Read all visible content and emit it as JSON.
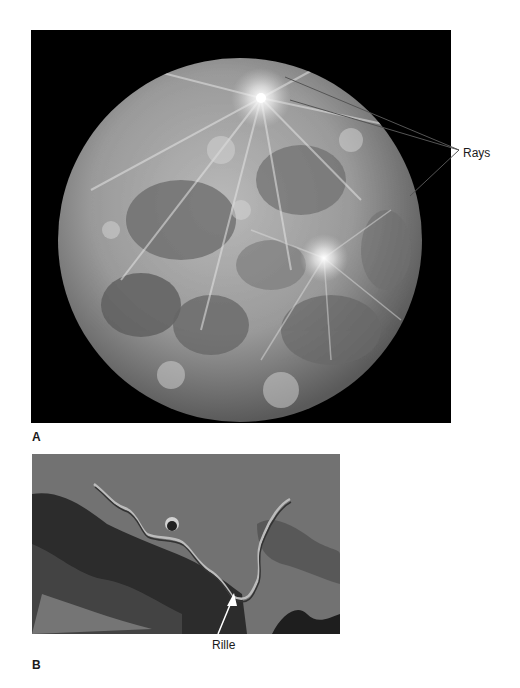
{
  "figure": {
    "panels": [
      {
        "id": "A",
        "letter": "A",
        "subject": "Full Moon photograph",
        "annotations": [
          {
            "label": "Rays",
            "leader_lines": 3
          }
        ]
      },
      {
        "id": "B",
        "letter": "B",
        "subject": "Oblique lunar surface photograph showing a sinuous channel",
        "annotations": [
          {
            "label": "Rille",
            "leader_lines": 1,
            "arrow_color": "#ffffff"
          }
        ]
      }
    ]
  },
  "labels": {
    "rays": "Rays",
    "rille": "Rille",
    "panel_a": "A",
    "panel_b": "B"
  },
  "colors": {
    "background": "#ffffff",
    "space": "#000000",
    "leader_line": "#555555",
    "text": "#1a1a1a"
  }
}
